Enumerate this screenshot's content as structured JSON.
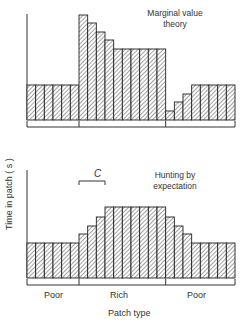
{
  "chart_data": [
    {
      "type": "bar",
      "title": "Marginal value theory",
      "xlabel": "Patch type",
      "ylabel": "Time in patch (s)",
      "categories": [
        "Poor",
        "Poor",
        "Poor",
        "Poor",
        "Poor",
        "Poor",
        "Rich",
        "Rich",
        "Rich",
        "Rich",
        "Rich",
        "Rich",
        "Rich",
        "Rich",
        "Rich",
        "Rich",
        "Poor",
        "Poor",
        "Poor",
        "Poor",
        "Poor",
        "Poor",
        "Poor",
        "Poor"
      ],
      "values": [
        35,
        35,
        35,
        35,
        35,
        35,
        105,
        97,
        88,
        80,
        71,
        71,
        71,
        71,
        71,
        71,
        9,
        18,
        26,
        35,
        35,
        35,
        35,
        35
      ],
      "groups": [
        {
          "label": "Poor",
          "count": 6
        },
        {
          "label": "Rich",
          "count": 10
        },
        {
          "label": "Poor",
          "count": 8
        }
      ],
      "ylim": [
        0,
        110
      ],
      "grid": false
    },
    {
      "type": "bar",
      "title": "Hunting by expectation",
      "xlabel": "Patch type",
      "ylabel": "Time in patch (s)",
      "categories": [
        "Poor",
        "Poor",
        "Poor",
        "Poor",
        "Poor",
        "Poor",
        "Rich",
        "Rich",
        "Rich",
        "Rich",
        "Rich",
        "Rich",
        "Rich",
        "Rich",
        "Rich",
        "Rich",
        "Poor",
        "Poor",
        "Poor",
        "Poor",
        "Poor",
        "Poor",
        "Poor",
        "Poor"
      ],
      "values": [
        35,
        35,
        35,
        35,
        35,
        35,
        44,
        52,
        61,
        71,
        71,
        71,
        71,
        71,
        71,
        71,
        61,
        52,
        44,
        35,
        35,
        35,
        35,
        35
      ],
      "groups": [
        {
          "label": "Poor",
          "count": 6
        },
        {
          "label": "Rich",
          "count": 10
        },
        {
          "label": "Poor",
          "count": 8
        }
      ],
      "annotation": {
        "label": "C",
        "span_bars": [
          6,
          9
        ]
      },
      "ylim": [
        0,
        110
      ],
      "grid": false
    }
  ],
  "labels": {
    "top_title_line1": "Marginal value",
    "top_title_line2": "theory",
    "bottom_title_line1": "Hunting by",
    "bottom_title_line2": "expectation",
    "annotation_c": "C",
    "ylabel": "Time in patch ( s )",
    "xlabel": "Patch type",
    "group_poor_left": "Poor",
    "group_rich": "Rich",
    "group_poor_right": "Poor"
  }
}
